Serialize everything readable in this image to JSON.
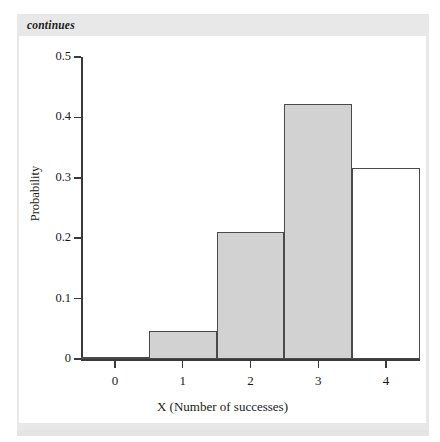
{
  "figure": {
    "continues_note": "continues"
  },
  "chart_data": {
    "type": "bar",
    "title": "",
    "subtitle": "",
    "xlabel": "X (Number of successes)",
    "ylabel": "Probability",
    "categories": [
      "0",
      "1",
      "2",
      "3",
      "4"
    ],
    "values": [
      0.004,
      0.047,
      0.211,
      0.422,
      0.316
    ],
    "bar_styles": [
      "filled",
      "filled",
      "filled",
      "filled",
      "open"
    ],
    "bar_fill_color": "#d2d2d2",
    "bar_edge_color": "#4a4a4a",
    "xlim": [
      -0.5,
      4.5
    ],
    "ylim": [
      0,
      0.5
    ],
    "xticks": [
      "0",
      "1",
      "2",
      "3",
      "4"
    ],
    "yticks": [
      "0",
      "0.1",
      "0.2",
      "0.3",
      "0.4",
      "0.5"
    ],
    "ytick_values": [
      0,
      0.1,
      0.2,
      0.3,
      0.4,
      0.5
    ],
    "grid": false,
    "legend": null,
    "annotations": []
  }
}
